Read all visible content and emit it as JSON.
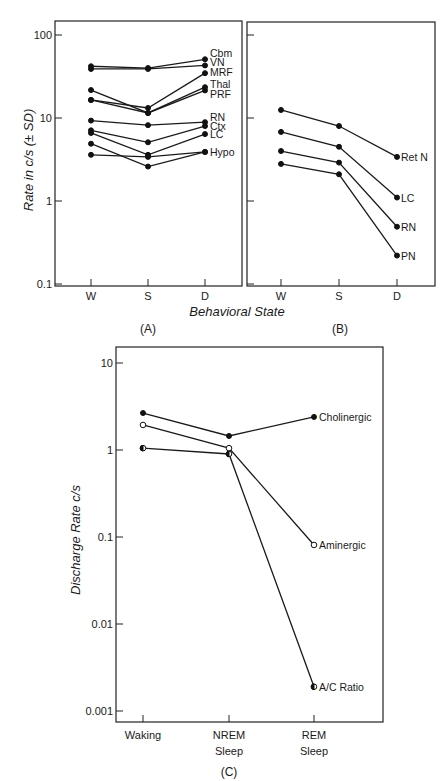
{
  "chart_data": [
    {
      "panel": "A",
      "type": "line",
      "scale": "log",
      "panel_label": "(A)",
      "ylabel": "Rate in c/s (± SD)",
      "xlabel": "Behavioral State",
      "ylim": [
        0.1,
        100
      ],
      "yticks": [
        {
          "value": 100,
          "label": "100"
        },
        {
          "value": 10,
          "label": "10"
        },
        {
          "value": 1,
          "label": "1"
        },
        {
          "value": 0.1,
          "label": "0.1"
        }
      ],
      "categories": [
        "W",
        "S",
        "D"
      ],
      "series": [
        {
          "name": "Cbm",
          "values": [
            42,
            40,
            51
          ]
        },
        {
          "name": "VN",
          "values": [
            39,
            39,
            43
          ]
        },
        {
          "name": "MRF",
          "values": [
            16.5,
            13.2,
            34.7
          ]
        },
        {
          "name": "Thal",
          "values": [
            21.7,
            11.5,
            23.5
          ]
        },
        {
          "name": "PRF",
          "values": [
            16.5,
            11.5,
            21.5
          ]
        },
        {
          "name": "RN",
          "values": [
            9.3,
            8.2,
            8.9
          ]
        },
        {
          "name": "Ctx",
          "values": [
            7.1,
            5.1,
            8.0
          ]
        },
        {
          "name": "LC",
          "values": [
            6.6,
            3.6,
            6.4
          ]
        },
        {
          "name": "Hypo",
          "values": [
            3.6,
            3.4,
            3.9
          ]
        },
        {
          "name": "",
          "values": [
            4.9,
            2.6,
            3.9
          ]
        }
      ]
    },
    {
      "panel": "B",
      "type": "line",
      "scale": "log",
      "panel_label": "(B)",
      "ylim": [
        0.1,
        100
      ],
      "categories": [
        "W",
        "S",
        "D"
      ],
      "series": [
        {
          "name": "Ret N",
          "values": [
            12.5,
            8.0,
            3.4
          ]
        },
        {
          "name": "LC",
          "values": [
            6.8,
            4.5,
            1.1
          ]
        },
        {
          "name": "RN",
          "values": [
            4.0,
            2.9,
            0.49
          ]
        },
        {
          "name": "PN",
          "values": [
            2.8,
            2.1,
            0.22
          ]
        }
      ]
    },
    {
      "panel": "C",
      "type": "line",
      "scale": "log",
      "panel_label": "(C)",
      "ylabel": "Discharge Rate c/s",
      "ylim": [
        0.001,
        10
      ],
      "yticks": [
        {
          "value": 10,
          "label": "10"
        },
        {
          "value": 1,
          "label": "1"
        },
        {
          "value": 0.1,
          "label": "0.1"
        },
        {
          "value": 0.01,
          "label": "0.01"
        },
        {
          "value": 0.001,
          "label": "0.001"
        }
      ],
      "categories": [
        [
          "Waking"
        ],
        [
          "NREM",
          "Sleep"
        ],
        [
          "REM",
          "Sleep"
        ]
      ],
      "series": [
        {
          "name": "Cholinergic",
          "marker": "filled",
          "values": [
            2.66,
            1.45,
            2.4
          ]
        },
        {
          "name": "Aminergic",
          "marker": "open",
          "values": [
            1.94,
            1.05,
            0.081
          ]
        },
        {
          "name": "A/C Ratio",
          "marker": "half",
          "values": [
            1.05,
            0.9,
            0.0019
          ]
        }
      ]
    }
  ]
}
